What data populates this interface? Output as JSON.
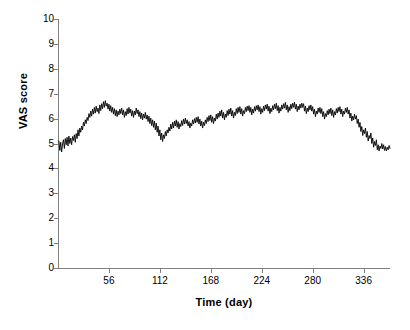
{
  "chart_data": {
    "type": "line",
    "title": "",
    "xlabel": "Time (day)",
    "ylabel": "VAS score",
    "xlim": [
      0,
      365
    ],
    "ylim": [
      0,
      10
    ],
    "grid": false,
    "legend": null,
    "line_color": "#000000",
    "background_color": "#ffffff",
    "axis_color": "#808080",
    "ytick_labels": [
      "10",
      "9",
      "8",
      "7",
      "6",
      "5",
      "4",
      "3",
      "2",
      "1",
      "0"
    ],
    "ytick_values": [
      10,
      9,
      8,
      7,
      6,
      5,
      4,
      3,
      2,
      1,
      0
    ],
    "xtick_labels": [
      "56",
      "112",
      "168",
      "224",
      "280",
      "336"
    ],
    "xtick_values": [
      56,
      112,
      168,
      224,
      280,
      336
    ],
    "series": [
      {
        "name": "VAS score",
        "x_start": 1,
        "x_step": 1,
        "values": [
          5.1,
          4.72,
          5.05,
          4.66,
          4.98,
          5.15,
          4.8,
          5.2,
          4.95,
          5.25,
          4.9,
          5.3,
          5.0,
          5.22,
          4.95,
          5.28,
          5.12,
          5.35,
          5.05,
          5.4,
          5.2,
          5.55,
          5.3,
          5.62,
          5.45,
          5.7,
          5.55,
          5.85,
          5.7,
          5.95,
          5.8,
          6.05,
          5.92,
          6.2,
          6.05,
          6.3,
          6.1,
          6.38,
          6.18,
          6.45,
          6.22,
          6.5,
          6.28,
          6.42,
          6.2,
          6.55,
          6.32,
          6.6,
          6.4,
          6.68,
          6.45,
          6.72,
          6.5,
          6.62,
          6.38,
          6.58,
          6.3,
          6.52,
          6.25,
          6.45,
          6.18,
          6.4,
          6.12,
          6.35,
          6.08,
          6.3,
          6.15,
          6.38,
          6.2,
          6.42,
          6.15,
          6.35,
          6.05,
          6.28,
          6.12,
          6.4,
          6.18,
          6.45,
          6.22,
          6.38,
          6.1,
          6.32,
          6.05,
          6.3,
          6.15,
          6.42,
          6.2,
          6.35,
          6.08,
          6.28,
          6.0,
          6.22,
          5.95,
          6.18,
          6.02,
          6.25,
          5.98,
          6.15,
          5.88,
          6.1,
          5.8,
          6.02,
          5.72,
          5.95,
          5.65,
          5.9,
          5.55,
          5.82,
          5.45,
          5.7,
          5.3,
          5.55,
          5.15,
          5.42,
          5.08,
          5.35,
          5.2,
          5.48,
          5.3,
          5.55,
          5.42,
          5.65,
          5.5,
          5.78,
          5.58,
          5.85,
          5.62,
          5.9,
          5.7,
          5.95,
          5.65,
          5.88,
          5.58,
          5.8,
          5.68,
          5.92,
          5.72,
          5.98,
          5.78,
          6.02,
          5.8,
          5.95,
          5.7,
          5.88,
          5.62,
          5.82,
          5.7,
          5.95,
          5.78,
          6.0,
          5.82,
          6.05,
          5.85,
          6.08,
          5.78,
          5.98,
          5.7,
          5.9,
          5.62,
          5.85,
          5.72,
          5.95,
          5.8,
          6.05,
          5.88,
          6.12,
          5.92,
          6.15,
          5.85,
          6.08,
          5.8,
          6.02,
          5.9,
          6.18,
          5.98,
          6.22,
          6.05,
          6.3,
          6.1,
          6.35,
          6.02,
          6.25,
          5.95,
          6.18,
          6.05,
          6.32,
          6.12,
          6.38,
          6.18,
          6.42,
          6.1,
          6.32,
          6.02,
          6.25,
          6.12,
          6.4,
          6.2,
          6.45,
          6.25,
          6.48,
          6.18,
          6.4,
          6.1,
          6.32,
          6.2,
          6.45,
          6.28,
          6.5,
          6.32,
          6.52,
          6.25,
          6.45,
          6.15,
          6.38,
          6.22,
          6.48,
          6.3,
          6.52,
          6.35,
          6.55,
          6.28,
          6.48,
          6.18,
          6.4,
          6.25,
          6.5,
          6.32,
          6.55,
          6.38,
          6.58,
          6.3,
          6.5,
          6.2,
          6.42,
          6.28,
          6.52,
          6.35,
          6.58,
          6.4,
          6.62,
          6.32,
          6.52,
          6.22,
          6.45,
          6.3,
          6.55,
          6.38,
          6.6,
          6.42,
          6.65,
          6.35,
          6.55,
          6.25,
          6.48,
          6.32,
          6.58,
          6.4,
          6.62,
          6.45,
          6.66,
          6.38,
          6.58,
          6.28,
          6.5,
          6.35,
          6.58,
          6.42,
          6.62,
          6.45,
          6.6,
          6.3,
          6.5,
          6.2,
          6.42,
          6.28,
          6.52,
          6.35,
          6.55,
          6.3,
          6.48,
          6.18,
          6.38,
          6.08,
          6.3,
          6.18,
          6.42,
          6.25,
          6.45,
          6.2,
          6.4,
          6.08,
          6.28,
          5.98,
          6.2,
          6.08,
          6.32,
          6.15,
          6.38,
          6.2,
          6.42,
          6.12,
          6.35,
          6.05,
          6.28,
          6.15,
          6.4,
          6.22,
          6.45,
          6.28,
          6.48,
          6.18,
          6.38,
          6.08,
          6.3,
          6.18,
          6.42,
          6.25,
          6.45,
          6.18,
          6.35,
          6.02,
          6.22,
          5.9,
          6.1,
          5.95,
          6.18,
          5.98,
          6.12,
          5.8,
          5.98,
          5.65,
          5.85,
          5.48,
          5.68,
          5.32,
          5.55,
          5.4,
          5.62,
          5.25,
          5.48,
          5.1,
          5.32,
          5.2,
          5.42,
          5.0,
          5.22,
          4.85,
          5.08,
          4.92,
          5.15,
          4.75,
          4.95,
          4.7,
          4.9,
          4.8,
          5.0,
          4.78,
          4.95,
          4.72,
          4.88,
          4.7,
          4.85,
          4.75,
          4.92,
          4.8
        ]
      }
    ]
  },
  "axes": {
    "y_axis_name": "y-axis",
    "x_axis_name": "x-axis"
  }
}
